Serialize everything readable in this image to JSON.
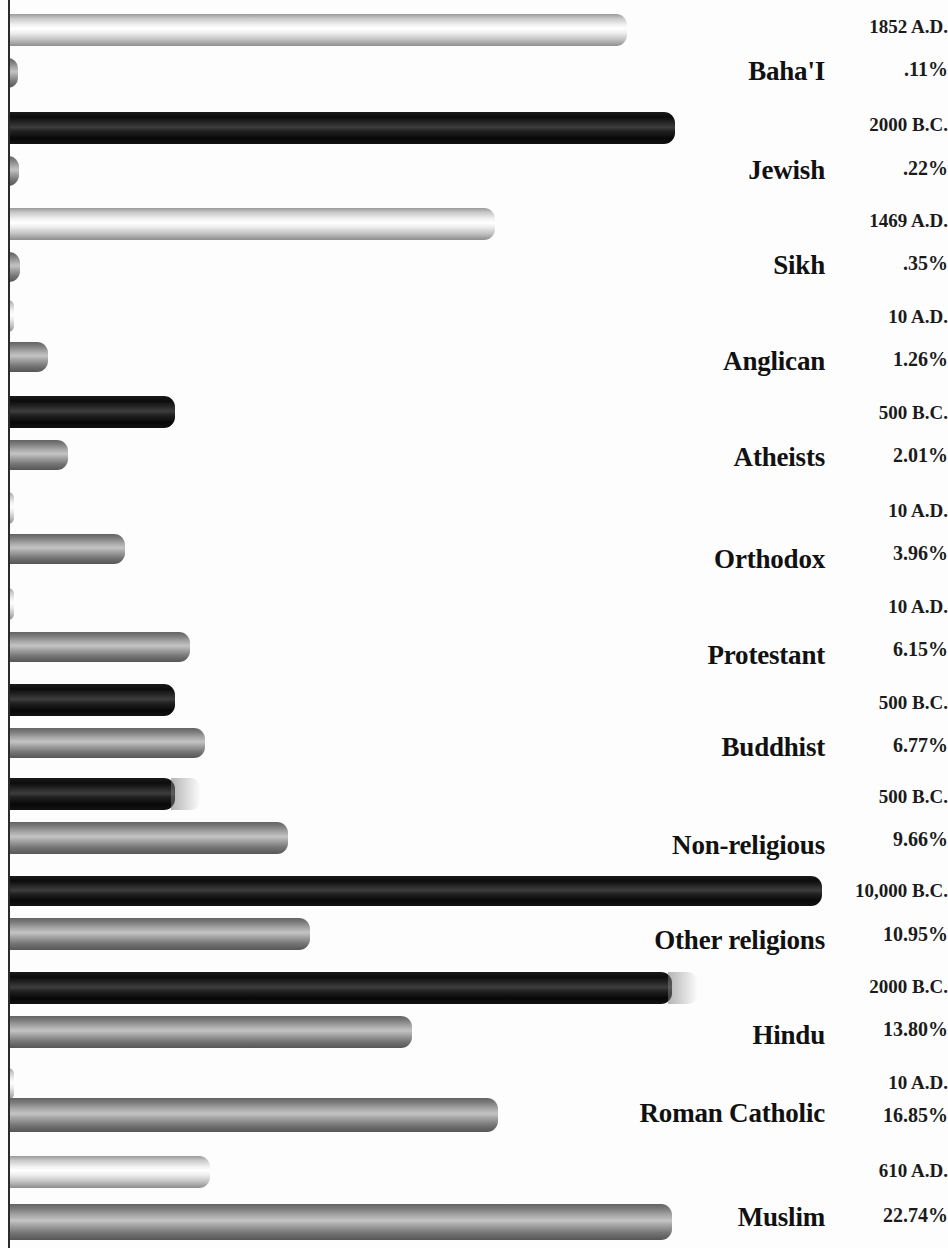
{
  "chart_data": {
    "type": "bar",
    "title": "",
    "subtitle": "",
    "xlabel": "",
    "ylabel": "",
    "orientation": "horizontal",
    "grid": false,
    "legend_position": "none",
    "categories": [
      "Baha'I",
      "Jewish",
      "Sikh",
      "Anglican",
      "Atheists",
      "Orthodox",
      "Protestant",
      "Buddhist",
      "Non-religious",
      "Other religions",
      "Hindu",
      "Roman Catholic",
      "Muslim"
    ],
    "series": [
      {
        "name": "Founding date",
        "values": [
          "1852 A.D.",
          "2000 B.C.",
          "1469 A.D.",
          "10 A.D.",
          "500 B.C.",
          "10 A.D.",
          "10 A.D.",
          "500 B.C.",
          "500 B.C.",
          "10,000 B.C.",
          "2000 B.C.",
          "10 A.D.",
          "610 A.D."
        ]
      },
      {
        "name": "Share of world population",
        "values": [
          ".11%",
          ".22%",
          ".35%",
          "1.26%",
          "2.01%",
          "3.96%",
          "6.15%",
          "6.77%",
          "9.66%",
          "10.95%",
          "13.80%",
          "16.85%",
          "22.74%"
        ],
        "numeric": [
          0.11,
          0.22,
          0.35,
          1.26,
          2.01,
          3.96,
          6.15,
          6.77,
          9.66,
          10.95,
          13.8,
          16.85,
          22.74
        ]
      }
    ],
    "colors": {
      "light_bar": "#e8e8e8",
      "dark_bar": "#141414",
      "mid_bar": "#9a9a9a",
      "axis": "#2a2a2a",
      "text": "#111111",
      "background": "#ffffff"
    }
  },
  "rows": [
    {
      "category": "Baha'I",
      "year": "1852 A.D.",
      "pct": ".11%",
      "year_bar": {
        "width": 619,
        "style": "light",
        "top": 14,
        "height": 32,
        "smear": false
      },
      "pct_bar": {
        "width": 10,
        "style": "mid",
        "top": 58,
        "height": 30,
        "smear": false
      },
      "cat_top": 56,
      "year_top": 16,
      "pct_top": 58
    },
    {
      "category": "Jewish",
      "year": "2000 B.C.",
      "pct": ".22%",
      "year_bar": {
        "width": 667,
        "style": "dark",
        "top": 112,
        "height": 32,
        "smear": false
      },
      "pct_bar": {
        "width": 11,
        "style": "mid",
        "top": 156,
        "height": 30,
        "smear": false
      },
      "cat_top": 155,
      "year_top": 114,
      "pct_top": 157
    },
    {
      "category": "Sikh",
      "year": "1469 A.D.",
      "pct": ".35%",
      "year_bar": {
        "width": 487,
        "style": "light",
        "top": 208,
        "height": 32,
        "smear": false
      },
      "pct_bar": {
        "width": 12,
        "style": "mid",
        "top": 252,
        "height": 30,
        "smear": false
      },
      "cat_top": 250,
      "year_top": 210,
      "pct_top": 252
    },
    {
      "category": "Anglican",
      "year": "10 A.D.",
      "pct": "1.26%",
      "year_bar": {
        "width": 6,
        "style": "light",
        "top": 300,
        "height": 32,
        "smear": false
      },
      "pct_bar": {
        "width": 40,
        "style": "mid",
        "top": 342,
        "height": 30,
        "smear": false
      },
      "cat_top": 346,
      "year_top": 306,
      "pct_top": 348
    },
    {
      "category": "Atheists",
      "year": "500 B.C.",
      "pct": "2.01%",
      "year_bar": {
        "width": 167,
        "style": "dark",
        "top": 396,
        "height": 32,
        "smear": false
      },
      "pct_bar": {
        "width": 60,
        "style": "mid",
        "top": 440,
        "height": 30,
        "smear": false
      },
      "cat_top": 442,
      "year_top": 402,
      "pct_top": 444
    },
    {
      "category": "Orthodox",
      "year": "10 A.D.",
      "pct": "3.96%",
      "year_bar": {
        "width": 6,
        "style": "light",
        "top": 492,
        "height": 32,
        "smear": false
      },
      "pct_bar": {
        "width": 117,
        "style": "mid",
        "top": 534,
        "height": 30,
        "smear": false
      },
      "cat_top": 544,
      "year_top": 500,
      "pct_top": 542
    },
    {
      "category": "Protestant",
      "year": "10 A.D.",
      "pct": "6.15%",
      "year_bar": {
        "width": 6,
        "style": "light",
        "top": 588,
        "height": 32,
        "smear": false
      },
      "pct_bar": {
        "width": 182,
        "style": "mid",
        "top": 632,
        "height": 30,
        "smear": false
      },
      "cat_top": 640,
      "year_top": 596,
      "pct_top": 638
    },
    {
      "category": "Buddhist",
      "year": "500 B.C.",
      "pct": "6.77%",
      "year_bar": {
        "width": 167,
        "style": "dark",
        "top": 684,
        "height": 32,
        "smear": false
      },
      "pct_bar": {
        "width": 197,
        "style": "mid",
        "top": 728,
        "height": 30,
        "smear": false
      },
      "cat_top": 732,
      "year_top": 692,
      "pct_top": 734
    },
    {
      "category": "Non-religious",
      "year": "500 B.C.",
      "pct": "9.66%",
      "year_bar": {
        "width": 167,
        "style": "dark",
        "top": 778,
        "height": 32,
        "smear": true
      },
      "pct_bar": {
        "width": 280,
        "style": "mid",
        "top": 822,
        "height": 32,
        "smear": false
      },
      "cat_top": 830,
      "year_top": 786,
      "pct_top": 828
    },
    {
      "category": "Other religions",
      "year": "10,000 B.C.",
      "pct": "10.95%",
      "year_bar": {
        "width": 814,
        "style": "dark",
        "top": 876,
        "height": 30,
        "smear": false
      },
      "pct_bar": {
        "width": 302,
        "style": "mid",
        "top": 918,
        "height": 32,
        "smear": false
      },
      "cat_top": 925,
      "year_top": 880,
      "pct_top": 923
    },
    {
      "category": "Hindu",
      "year": "2000 B.C.",
      "pct": "13.80%",
      "year_bar": {
        "width": 664,
        "style": "dark",
        "top": 972,
        "height": 32,
        "smear": true
      },
      "pct_bar": {
        "width": 404,
        "style": "mid",
        "top": 1016,
        "height": 32,
        "smear": false
      },
      "cat_top": 1020,
      "year_top": 976,
      "pct_top": 1018
    },
    {
      "category": "Roman Catholic",
      "year": "10 A.D.",
      "pct": "16.85%",
      "year_bar": {
        "width": 6,
        "style": "light",
        "top": 1068,
        "height": 32,
        "smear": false
      },
      "pct_bar": {
        "width": 490,
        "style": "mid",
        "top": 1098,
        "height": 34,
        "smear": false
      },
      "cat_top": 1098,
      "year_top": 1072,
      "pct_top": 1104
    },
    {
      "category": "Muslim",
      "year": "610 A.D.",
      "pct": "22.74%",
      "year_bar": {
        "width": 202,
        "style": "light",
        "top": 1156,
        "height": 32,
        "smear": false
      },
      "pct_bar": {
        "width": 664,
        "style": "mid",
        "top": 1204,
        "height": 36,
        "smear": false
      },
      "cat_top": 1202,
      "year_top": 1160,
      "pct_top": 1204
    }
  ]
}
